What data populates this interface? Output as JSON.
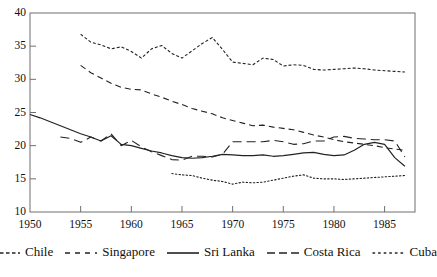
{
  "chart_data": {
    "type": "line",
    "title": "",
    "subtitle": "",
    "xlabel": "",
    "ylabel": "",
    "xlim": [
      1950,
      1988
    ],
    "ylim": [
      10,
      40
    ],
    "yticks": [
      10,
      15,
      20,
      25,
      30,
      35,
      40
    ],
    "xticks": [
      1950,
      1955,
      1960,
      1965,
      1970,
      1975,
      1980,
      1985
    ],
    "grid": false,
    "legend_position": "bottom",
    "series": [
      {
        "name": "Chile",
        "style": "fine-dash",
        "color": "#222222",
        "x": [
          1955,
          1956,
          1957,
          1958,
          1959,
          1960,
          1961,
          1962,
          1963,
          1964,
          1965,
          1966,
          1967,
          1968,
          1969,
          1970,
          1971,
          1972,
          1973,
          1974,
          1975,
          1976,
          1977,
          1978,
          1979,
          1980,
          1981,
          1982,
          1983,
          1984,
          1985,
          1986,
          1987
        ],
        "values": [
          36.8,
          35.6,
          35.2,
          34.6,
          34.9,
          34.2,
          33.2,
          34.6,
          35.1,
          33.9,
          33.2,
          34.3,
          35.4,
          36.3,
          34.5,
          32.6,
          32.4,
          32.2,
          33.2,
          33.0,
          32.0,
          32.2,
          32.1,
          31.5,
          31.4,
          31.5,
          31.6,
          31.7,
          31.6,
          31.4,
          31.3,
          31.2,
          31.1
        ]
      },
      {
        "name": "Singapore",
        "style": "medium-dash",
        "color": "#222222",
        "x": [
          1955,
          1956,
          1957,
          1958,
          1959,
          1960,
          1961,
          1962,
          1963,
          1964,
          1965,
          1966,
          1967,
          1968,
          1969,
          1970,
          1971,
          1972,
          1973,
          1974,
          1975,
          1976,
          1977,
          1978,
          1979,
          1980,
          1981,
          1982,
          1983,
          1984,
          1985,
          1986,
          1987
        ],
        "values": [
          32.1,
          31.0,
          30.2,
          29.4,
          28.8,
          28.5,
          28.4,
          27.8,
          27.3,
          26.7,
          26.2,
          25.6,
          25.2,
          24.8,
          24.2,
          23.8,
          23.4,
          23.0,
          23.1,
          22.8,
          22.6,
          22.4,
          22.0,
          21.6,
          21.3,
          20.9,
          20.6,
          20.4,
          20.2,
          20.0,
          19.7,
          19.5,
          19.3
        ]
      },
      {
        "name": "Sri Lanka",
        "style": "solid",
        "color": "#222222",
        "x": [
          1950,
          1951,
          1952,
          1953,
          1954,
          1955,
          1956,
          1957,
          1958,
          1959,
          1960,
          1961,
          1962,
          1963,
          1964,
          1965,
          1966,
          1967,
          1968,
          1969,
          1970,
          1971,
          1972,
          1973,
          1974,
          1975,
          1976,
          1977,
          1978,
          1979,
          1980,
          1981,
          1982,
          1983,
          1984,
          1985,
          1986,
          1987
        ],
        "values": [
          24.7,
          24.2,
          23.6,
          23.0,
          22.4,
          21.8,
          21.3,
          20.7,
          21.5,
          20.2,
          20.0,
          19.6,
          19.2,
          18.9,
          18.5,
          18.2,
          18.1,
          18.2,
          18.4,
          18.7,
          18.6,
          18.5,
          18.5,
          18.6,
          18.4,
          18.5,
          18.7,
          18.9,
          19.0,
          18.7,
          18.5,
          18.6,
          19.3,
          20.2,
          20.5,
          20.2,
          18.2,
          16.9
        ]
      },
      {
        "name": "Costa Rica",
        "style": "long-dash",
        "color": "#222222",
        "x": [
          1953,
          1954,
          1955,
          1956,
          1957,
          1958,
          1959,
          1960,
          1961,
          1962,
          1963,
          1964,
          1965,
          1966,
          1967,
          1968,
          1969,
          1970,
          1971,
          1972,
          1973,
          1974,
          1975,
          1976,
          1977,
          1978,
          1979,
          1980,
          1981,
          1982,
          1983,
          1984,
          1985,
          1986,
          1987
        ],
        "values": [
          21.3,
          21.1,
          20.5,
          21.3,
          20.7,
          21.8,
          20.0,
          20.8,
          19.8,
          19.1,
          18.5,
          17.9,
          17.8,
          18.4,
          18.4,
          18.3,
          18.7,
          20.6,
          20.6,
          20.6,
          20.6,
          20.8,
          20.6,
          20.2,
          20.3,
          20.7,
          20.7,
          21.3,
          21.4,
          21.1,
          21.0,
          20.9,
          20.9,
          20.7,
          18.3
        ]
      },
      {
        "name": "Cuba",
        "style": "dotted",
        "color": "#222222",
        "x": [
          1964,
          1965,
          1966,
          1967,
          1968,
          1969,
          1970,
          1971,
          1972,
          1973,
          1974,
          1975,
          1976,
          1977,
          1978,
          1979,
          1980,
          1981,
          1982,
          1983,
          1984,
          1985,
          1986,
          1987
        ],
        "values": [
          15.8,
          15.6,
          15.5,
          15.1,
          14.8,
          14.6,
          14.2,
          14.5,
          14.4,
          14.5,
          14.8,
          15.1,
          15.4,
          15.6,
          15.1,
          15.0,
          15.0,
          14.9,
          15.0,
          15.1,
          15.2,
          15.3,
          15.4,
          15.5
        ]
      }
    ]
  },
  "axes": {
    "ytick_labels": [
      "40",
      "35",
      "30",
      "25",
      "20",
      "15",
      "10"
    ],
    "xtick_labels": [
      "1950",
      "1955",
      "1960",
      "1965",
      "1970",
      "1975",
      "1980",
      "1985"
    ]
  },
  "legend": {
    "items": [
      {
        "label": "Chile",
        "style": "fine-dash"
      },
      {
        "label": "Singapore",
        "style": "medium-dash"
      },
      {
        "label": "Sri Lanka",
        "style": "solid"
      },
      {
        "label": "Costa Rica",
        "style": "long-dash"
      },
      {
        "label": "Cuba",
        "style": "dotted"
      }
    ]
  },
  "caption": {
    "partial_text": ""
  }
}
